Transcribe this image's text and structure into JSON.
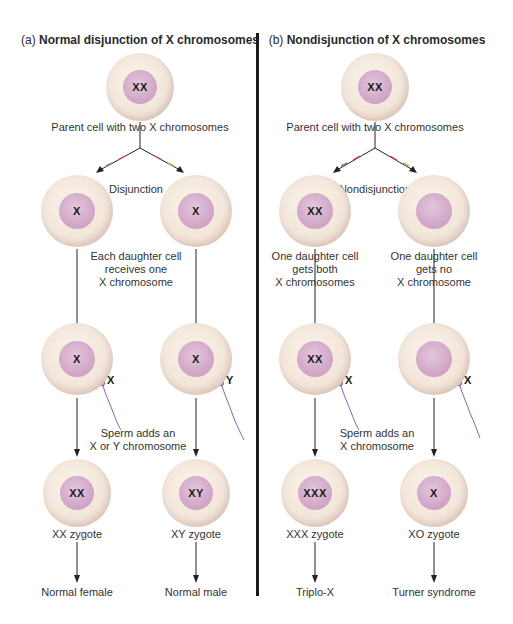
{
  "panel_a": {
    "prefix": "(a)",
    "title": "Normal disjunction of X chromosomes",
    "parent_nucleus": "XX",
    "parent_caption": "Parent cell with two X chromosomes",
    "branch_label": "Disjunction",
    "daughter_left_nucleus": "X",
    "daughter_right_nucleus": "X",
    "daughter_caption": [
      "Each daughter cell",
      "receives one",
      "X chromosome"
    ],
    "fert_left_nucleus": "X",
    "fert_right_nucleus": "X",
    "sperm_left_label": "X",
    "sperm_right_label": "Y",
    "sperm_caption": [
      "Sperm adds an",
      "X or Y chromosome"
    ],
    "zygote_left_nucleus": "XX",
    "zygote_right_nucleus": "XY",
    "zygote_left_caption": "XX zygote",
    "zygote_right_caption": "XY zygote",
    "outcome_left": "Normal female",
    "outcome_right": "Normal male"
  },
  "panel_b": {
    "prefix": "(b)",
    "title": "Nondisjunction of X chromosomes",
    "parent_nucleus": "XX",
    "parent_caption": "Parent cell with two X chromosomes",
    "branch_label": "Nondisjunction",
    "daughter_left_nucleus": "XX",
    "daughter_right_nucleus": "",
    "daughter_left_caption": [
      "One daughter cell",
      "gets both",
      "X chromosomes"
    ],
    "daughter_right_caption": [
      "One daughter cell",
      "gets no",
      "X chromosome"
    ],
    "fert_left_nucleus": "XX",
    "fert_right_nucleus": "",
    "sperm_left_label": "X",
    "sperm_right_label": "X",
    "sperm_caption": [
      "Sperm adds an",
      "X chromosome"
    ],
    "zygote_left_nucleus": "XXX",
    "zygote_right_nucleus": "X",
    "zygote_left_caption": "XXX zygote",
    "zygote_right_caption": "XO zygote",
    "outcome_left": "Triplo-X",
    "outcome_right": "Turner syndrome"
  },
  "colors": {
    "cell": "#f3e6da",
    "nucleus": "#d2a8c8",
    "sperm": "#8a64a8",
    "divider": "#1b1b1b"
  }
}
